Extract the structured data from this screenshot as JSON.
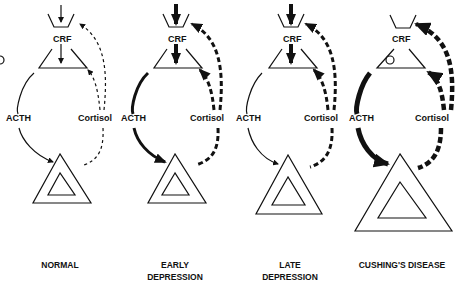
{
  "figure": {
    "panels": [
      {
        "id": "normal",
        "caption_line1": "NORMAL",
        "caption_line2": "",
        "crf_label": "CRF",
        "acth_label": "ACTH",
        "cortisol_label": "Cortisol",
        "acth_strength": "thin",
        "cortisol_feedback": "thin-dashed",
        "crf_arrow": "thin",
        "adrenal_size": "normal",
        "pituitary_marker": "none"
      },
      {
        "id": "early-depression",
        "caption_line1": "EARLY",
        "caption_line2": "DEPRESSION",
        "crf_label": "CRF",
        "acth_label": "ACTH",
        "cortisol_label": "Cortisol",
        "acth_strength": "thick",
        "cortisol_feedback": "thick-dashed",
        "crf_arrow": "thick",
        "adrenal_size": "normal",
        "pituitary_marker": "none"
      },
      {
        "id": "late-depression",
        "caption_line1": "LATE",
        "caption_line2": "DEPRESSION",
        "crf_label": "CRF",
        "acth_label": "ACTH",
        "cortisol_label": "Cortisol",
        "acth_strength": "thin",
        "cortisol_feedback": "thick-dashed",
        "crf_arrow": "thick",
        "adrenal_size": "enlarged",
        "pituitary_marker": "none"
      },
      {
        "id": "cushings-disease",
        "caption_line1": "CUSHING'S DISEASE",
        "caption_line2": "",
        "crf_label": "CRF",
        "acth_label": "ACTH",
        "cortisol_label": "Cortisol",
        "acth_strength": "very-thick",
        "cortisol_feedback": "very-thick-dashed",
        "crf_arrow": "none",
        "adrenal_size": "greatly-enlarged",
        "pituitary_marker": "circle (adenoma)"
      }
    ]
  },
  "colors": {
    "ink": "#111111",
    "background": "#ffffff"
  }
}
